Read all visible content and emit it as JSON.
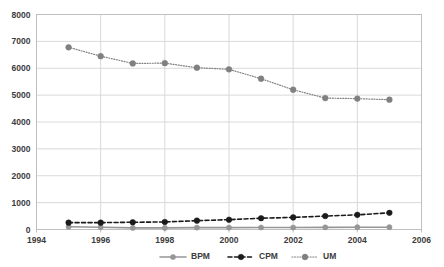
{
  "chart_data": {
    "type": "line",
    "title": "",
    "subtitle": "",
    "xlabel": "",
    "ylabel": "",
    "xlim": [
      1994,
      2006
    ],
    "ylim": [
      0,
      8000
    ],
    "x_ticks": [
      "1994",
      "1996",
      "1998",
      "2000",
      "2002",
      "2004",
      "2006"
    ],
    "y_ticks": [
      "0",
      "1000",
      "2000",
      "3000",
      "4000",
      "5000",
      "6000",
      "7000",
      "8000"
    ],
    "grid": true,
    "legend_position": "bottom",
    "x": [
      1995,
      1996,
      1997,
      1998,
      1999,
      2000,
      2001,
      2002,
      2003,
      2004,
      2005
    ],
    "series": [
      {
        "name": "BPM",
        "line_style": "solid",
        "color": "#969696",
        "marker": "circle",
        "values": [
          100,
          85,
          60,
          60,
          70,
          70,
          75,
          75,
          80,
          85,
          85
        ]
      },
      {
        "name": "CPM",
        "line_style": "dashed",
        "color": "#1a1a1a",
        "marker": "circle",
        "values": [
          255,
          255,
          270,
          280,
          330,
          365,
          420,
          450,
          500,
          545,
          620
        ]
      },
      {
        "name": "UM",
        "line_style": "dotted",
        "color": "#808080",
        "marker": "circle",
        "values": [
          6780,
          6450,
          6180,
          6190,
          6020,
          5960,
          5610,
          5200,
          4890,
          4870,
          4830
        ]
      }
    ]
  },
  "axis": {
    "y_labels": [
      "8000",
      "7000",
      "6000",
      "5000",
      "4000",
      "3000",
      "2000",
      "1000",
      "0"
    ],
    "x_labels": [
      "1994",
      "1996",
      "1998",
      "2000",
      "2002",
      "2004",
      "2006"
    ]
  },
  "legend": {
    "items": [
      {
        "label": "BPM",
        "style": "solid"
      },
      {
        "label": "CPM",
        "style": "dashed"
      },
      {
        "label": "UM",
        "style": "dotted"
      }
    ]
  },
  "colors": {
    "bpm": "#969696",
    "cpm": "#1a1a1a",
    "um": "#808080",
    "grid": "#d9d9d9",
    "border": "#bfbfbf",
    "text": "#3c3c3c",
    "background": "#ffffff"
  }
}
